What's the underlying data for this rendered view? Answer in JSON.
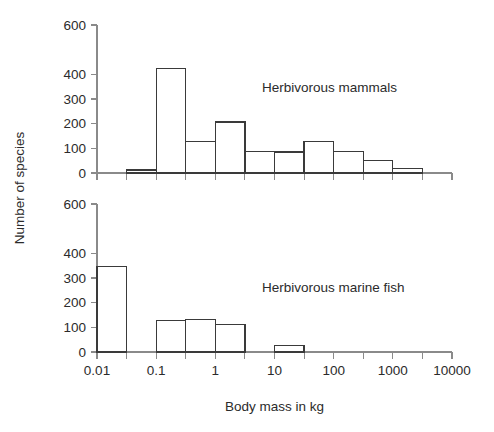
{
  "chart_data": {
    "type": "bar",
    "title": "",
    "xlabel": "Body mass in kg",
    "ylabel": "Number of species",
    "xscale": "log",
    "xlim": [
      0.01,
      10000
    ],
    "ylim": [
      0,
      600
    ],
    "grid": false,
    "legend": "none",
    "x_tick_labels": [
      "0.01",
      "0.1",
      "1",
      "10",
      "100",
      "1000",
      "10000"
    ],
    "x_tick_values": [
      0.01,
      0.1,
      1,
      10,
      100,
      1000,
      10000
    ],
    "x_minor_tick_values": [
      0.0316,
      0.316,
      3.16,
      31.6,
      316,
      3160
    ],
    "y_tick_labels": [
      "0",
      "100",
      "200",
      "300",
      "400",
      "600"
    ],
    "y_tick_values": [
      0,
      100,
      200,
      300,
      400,
      600
    ],
    "panels": [
      {
        "id": "herbivorous-mammals",
        "annotation": "Herbivorous mammals",
        "bins_log10": [
          -2,
          -1.5,
          -1,
          -0.5,
          0,
          0.5,
          1,
          1.5,
          2,
          2.5,
          3,
          3.5
        ],
        "bin_edges_kg": [
          0.01,
          0.0316,
          0.1,
          0.316,
          1,
          3.16,
          10,
          31.6,
          100,
          316,
          1000,
          3162
        ],
        "values": [
          0,
          12,
          425,
          127,
          207,
          88,
          85,
          127,
          88,
          50,
          17
        ]
      },
      {
        "id": "herbivorous-marine-fish",
        "annotation": "Herbivorous marine fish",
        "bins_log10": [
          -2,
          -1.5,
          -1,
          -0.5,
          0,
          0.5,
          1,
          1.5,
          2,
          2.5,
          3,
          3.5
        ],
        "bin_edges_kg": [
          0.01,
          0.0316,
          0.1,
          0.316,
          1,
          3.16,
          10,
          31.6,
          100,
          316,
          1000,
          3162
        ],
        "values": [
          347,
          0,
          129,
          133,
          113,
          0,
          27,
          0,
          0,
          0,
          0
        ]
      }
    ]
  }
}
